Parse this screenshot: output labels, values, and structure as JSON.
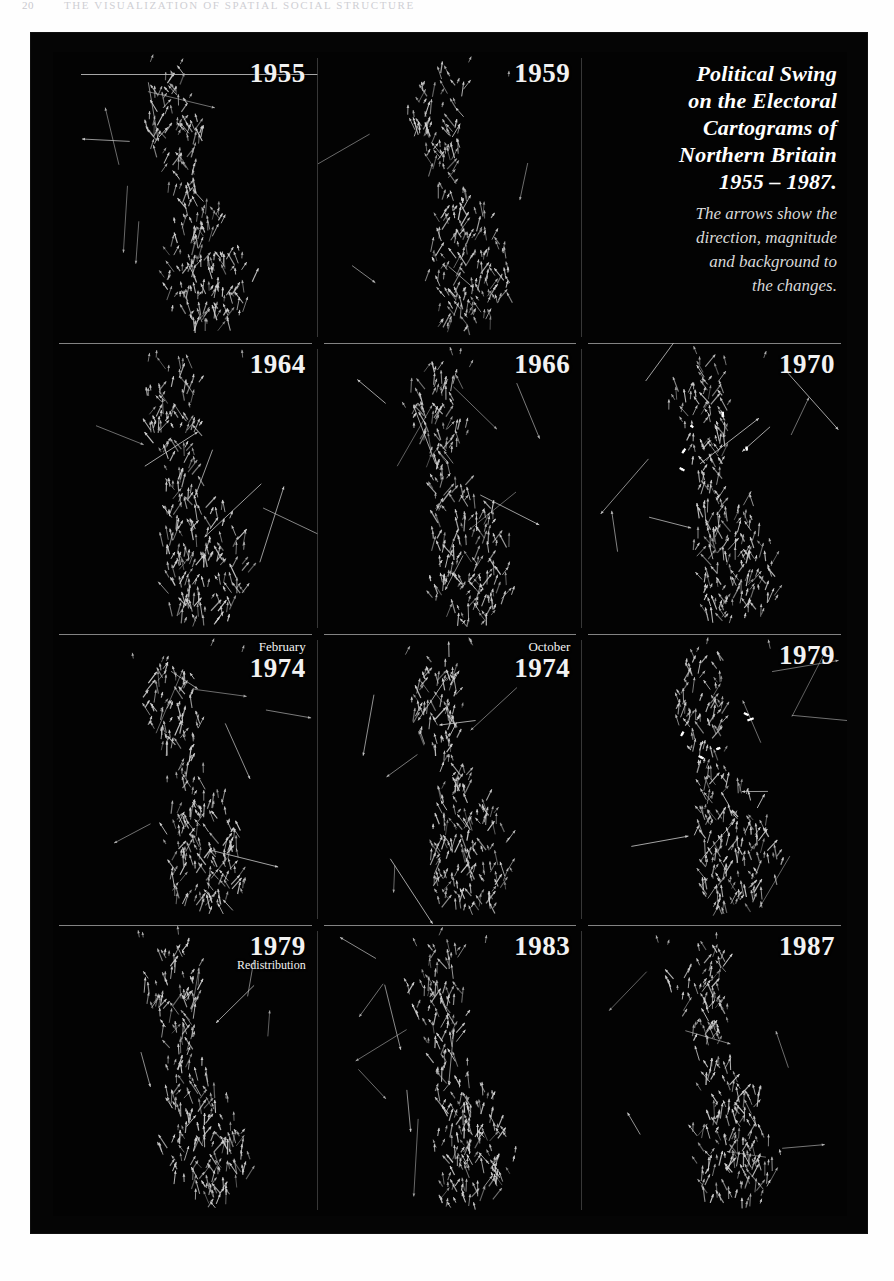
{
  "page": {
    "folio": "20",
    "running_head": "The Visualization of Spatial Social Structure"
  },
  "figure": {
    "title_block": {
      "title_lines": [
        "Political Swing",
        "on the Electoral",
        "Cartograms of",
        "Northern Britain",
        "1955 – 1987."
      ],
      "caption_lines": [
        "The arrows show the",
        "direction, magnitude",
        "and background to",
        "the changes."
      ]
    },
    "panels": [
      {
        "id": "panel-1955",
        "month": "",
        "year": "1955",
        "sub": "",
        "seed": 11,
        "glow": 0.0
      },
      {
        "id": "panel-1959",
        "month": "",
        "year": "1959",
        "sub": "",
        "seed": 23,
        "glow": 0.0
      },
      {
        "id": "panel-title",
        "month": "",
        "year": "",
        "sub": "",
        "seed": 0,
        "glow": 0.0
      },
      {
        "id": "panel-1964",
        "month": "",
        "year": "1964",
        "sub": "",
        "seed": 37,
        "glow": 0.0
      },
      {
        "id": "panel-1966",
        "month": "",
        "year": "1966",
        "sub": "",
        "seed": 41,
        "glow": 0.0
      },
      {
        "id": "panel-1970",
        "month": "",
        "year": "1970",
        "sub": "",
        "seed": 53,
        "glow": 0.9
      },
      {
        "id": "panel-1974-feb",
        "month": "February",
        "year": "1974",
        "sub": "",
        "seed": 67,
        "glow": 0.0
      },
      {
        "id": "panel-1974-oct",
        "month": "October",
        "year": "1974",
        "sub": "",
        "seed": 71,
        "glow": 0.0
      },
      {
        "id": "panel-1979",
        "month": "",
        "year": "1979",
        "sub": "",
        "seed": 83,
        "glow": 0.8
      },
      {
        "id": "panel-1979-redistribution",
        "month": "",
        "year": "1979",
        "sub": "Redistribution",
        "seed": 97,
        "glow": 0.0
      },
      {
        "id": "panel-1983",
        "month": "",
        "year": "1983",
        "sub": "",
        "seed": 101,
        "glow": 0.0
      },
      {
        "id": "panel-1987",
        "month": "",
        "year": "1987",
        "sub": "",
        "seed": 113,
        "glow": 0.0
      }
    ],
    "colors": {
      "plate_background": "#050505",
      "arrow_stroke": "#d0d0d0",
      "rule": "#9a9a9a",
      "caption_text": "#f2f2f2",
      "title_text": "#ffffff",
      "subtitle_text": "#d8d8d8",
      "page_background": "#fefefe"
    }
  },
  "chart_data": {
    "type": "scatter",
    "subtitle": "The arrows show the direction, magnitude and background to the changes.",
    "xlabel": "",
    "ylabel": "",
    "grid": false,
    "legend_position": "none",
    "small_multiples": [
      "1955",
      "1959",
      "title-block",
      "1964",
      "1966",
      "1970",
      "February 1974",
      "October 1974",
      "1979",
      "1979 Redistribution",
      "1983",
      "1987"
    ],
    "note": "Each small multiple is a vector-glyph cartogram of Northern Britain constituencies; every glyph encodes swing direction and magnitude."
  }
}
